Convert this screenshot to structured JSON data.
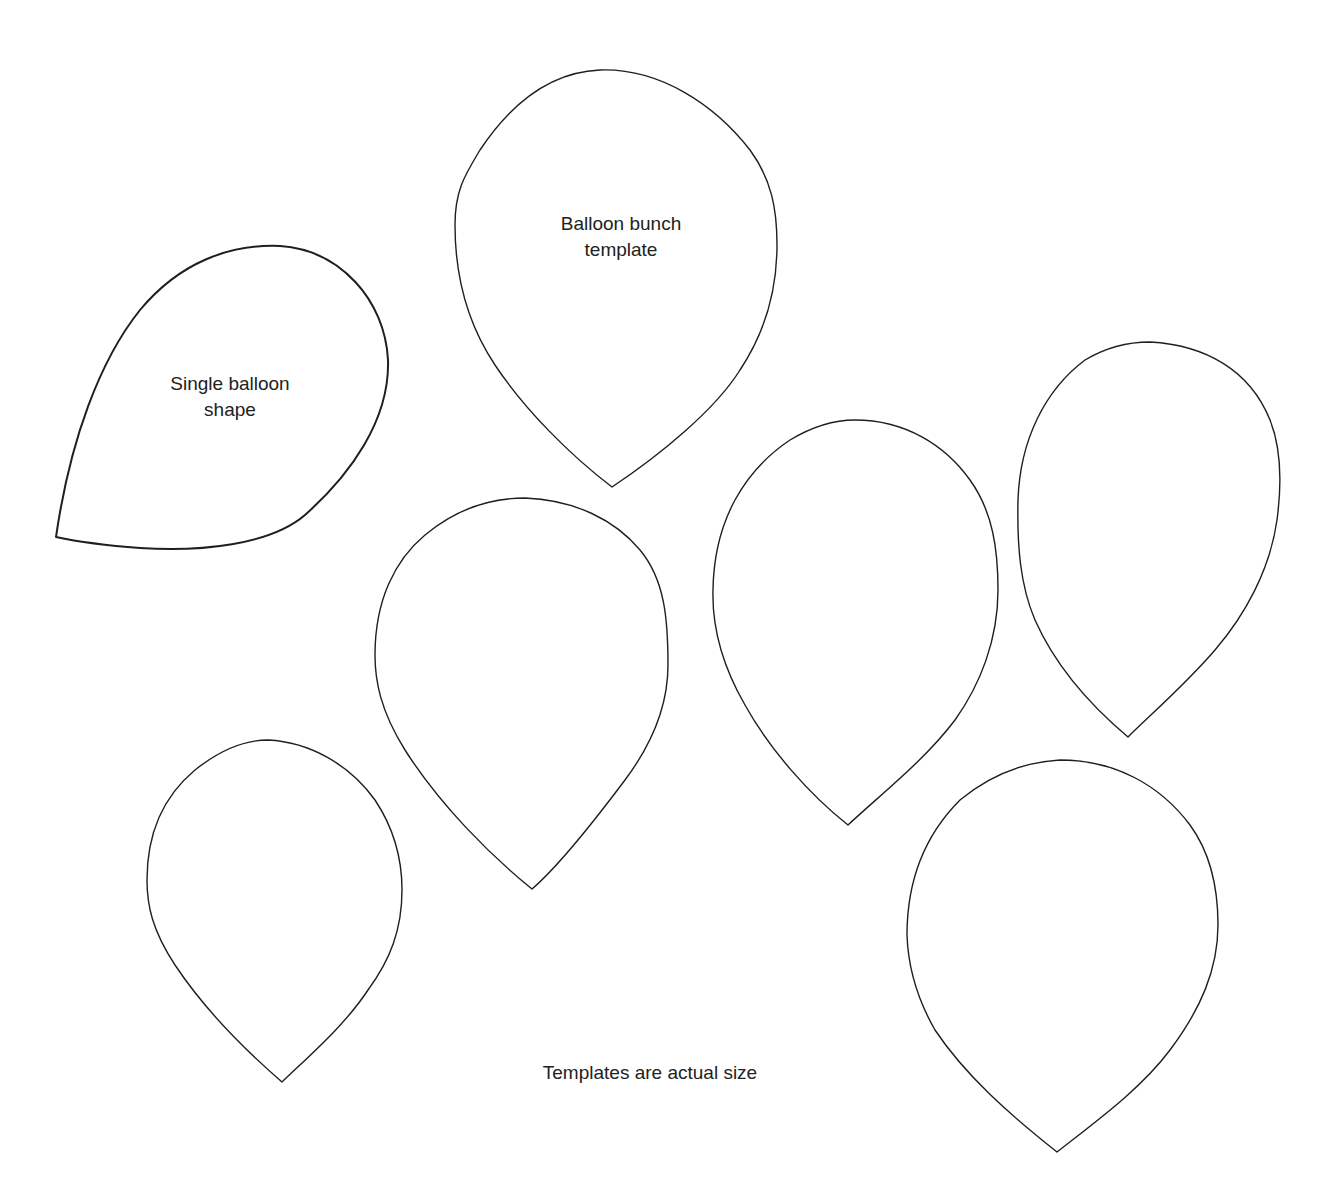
{
  "labels": {
    "bunch_template": {
      "line1": "Balloon bunch",
      "line2": "template"
    },
    "single_balloon": {
      "line1": "Single balloon",
      "line2": "shape"
    },
    "footer_note": "Templates are actual size"
  },
  "colors": {
    "background": "#ffffff",
    "outline": "#1f1f1f",
    "text": "#222222"
  },
  "shapes_count": 7
}
